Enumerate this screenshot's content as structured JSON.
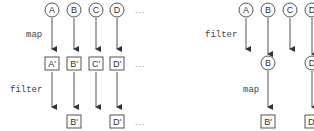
{
  "left_diagram": {
    "top_row": [
      "A",
      "B",
      "C",
      "D"
    ],
    "step1_label": "map",
    "mid_row": [
      "A'",
      "B'",
      "C'",
      "D'"
    ],
    "step2_label": "filter",
    "bottom_row": [
      "B'",
      "D'"
    ],
    "ellipsis": "..."
  },
  "right_diagram": {
    "top_row": [
      "A",
      "B",
      "C",
      "D"
    ],
    "step1_label": "filter",
    "mid_row": [
      "B",
      "D"
    ],
    "step2_label": "map",
    "bottom_row": [
      "B'",
      "D'"
    ]
  },
  "colors": {
    "stroke": "#555555",
    "text": "#333333"
  }
}
